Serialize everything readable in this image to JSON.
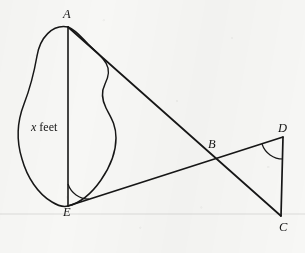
{
  "figure": {
    "background_color": "#f7f7f5",
    "ink_color": "#161616",
    "width": 305,
    "height": 253,
    "vertex_labels": [
      {
        "id": "A",
        "text": "A",
        "x": 63,
        "y": 8
      },
      {
        "id": "B",
        "text": "B",
        "x": 208,
        "y": 138
      },
      {
        "id": "C",
        "text": "C",
        "x": 279,
        "y": 221
      },
      {
        "id": "D",
        "text": "D",
        "x": 278,
        "y": 122
      },
      {
        "id": "E",
        "text": "E",
        "x": 63,
        "y": 206
      }
    ],
    "region_label": {
      "symbol": "x",
      "unit": " feet",
      "x": 31,
      "y": 121
    },
    "points": {
      "A": {
        "x": 68,
        "y": 27
      },
      "B": {
        "x": 211,
        "y": 155
      },
      "C": {
        "x": 281,
        "y": 216
      },
      "D": {
        "x": 283,
        "y": 137
      },
      "E": {
        "x": 68,
        "y": 206
      }
    },
    "segments": [
      {
        "name": "AE",
        "from": "A",
        "to": "E"
      },
      {
        "name": "AC",
        "from": "A",
        "to": "C"
      },
      {
        "name": "ED",
        "from": "E",
        "to": "D"
      },
      {
        "name": "DC",
        "from": "D",
        "to": "C"
      }
    ],
    "angle_marks": [
      {
        "name": "angle-at-E",
        "vertex": "E",
        "radius": 22
      },
      {
        "name": "angle-at-D",
        "vertex": "D",
        "radius": 22
      }
    ],
    "pond_outline_path": "M 68 27 C 52 24, 40 38, 37 56 C 34 73, 31 86, 24 104 C 17 122, 16 140, 22 159 C 27 177, 38 194, 52 202 C 60 207, 64 207, 68 206 C 80 203, 92 193, 101 180 C 110 167, 116 152, 116 138 C 116 124, 110 116, 106 108 C 102 100, 101 92, 105 84 C 109 76, 110 70, 106 63 C 101 55, 94 50, 88 44 C 82 38, 76 30, 68 27 Z",
    "scan_line": {
      "y": 214,
      "color": "rgba(120,120,118,0.35)"
    }
  }
}
